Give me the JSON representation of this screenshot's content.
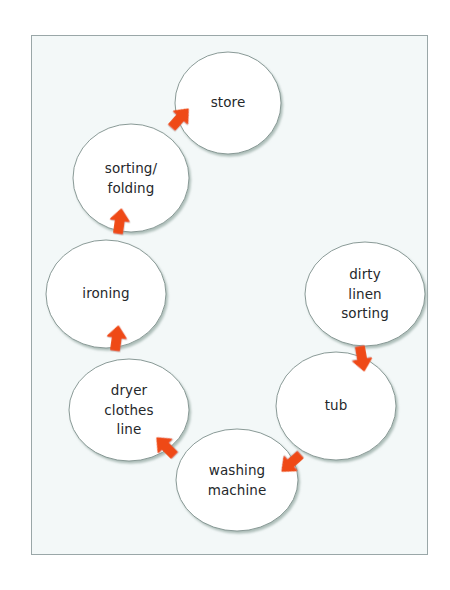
{
  "diagram": {
    "type": "cycle-flow",
    "frame": {
      "x": 31,
      "y": 35,
      "width": 397,
      "height": 520,
      "background_color": "#f3f8f8",
      "border_color": "#9aa7a8"
    },
    "style": {
      "node_fill": "#ffffff",
      "node_border_color": "#7d8f8b",
      "node_shadow_color": "#b9c6c2",
      "arrow_color": "#ef4a16",
      "label_color": "#25282b"
    },
    "nodes": [
      {
        "id": "store",
        "label": "store",
        "cx": 228,
        "cy": 103,
        "rx": 53,
        "ry": 51
      },
      {
        "id": "sorting-folding",
        "label": "sorting/\nfolding",
        "cx": 131,
        "cy": 178,
        "rx": 58,
        "ry": 54
      },
      {
        "id": "ironing",
        "label": "ironing",
        "cx": 106,
        "cy": 294,
        "rx": 60,
        "ry": 54
      },
      {
        "id": "dryer-clothes-line",
        "label": "dryer\nclothes\nline",
        "cx": 129,
        "cy": 410,
        "rx": 60,
        "ry": 51
      },
      {
        "id": "washing-machine",
        "label": "washing\nmachine",
        "cx": 237,
        "cy": 480,
        "rx": 61,
        "ry": 51
      },
      {
        "id": "tub",
        "label": "tub",
        "cx": 336,
        "cy": 406,
        "rx": 60,
        "ry": 54
      },
      {
        "id": "dirty-linen-sorting",
        "label": "dirty\nlinen\nsorting",
        "cx": 365,
        "cy": 294,
        "rx": 60,
        "ry": 52
      }
    ],
    "arrows": [
      {
        "id": "dirty-linen-sorting-to-tub",
        "from": "dirty-linen-sorting",
        "to": "tub",
        "x": 360,
        "y": 347,
        "rotation": 170
      },
      {
        "id": "tub-to-washing-machine",
        "from": "tub",
        "to": "washing-machine",
        "x": 300,
        "y": 455,
        "rotation": 228
      },
      {
        "id": "washing-machine-to-dryer",
        "from": "washing-machine",
        "to": "dryer-clothes-line",
        "x": 174,
        "y": 455,
        "rotation": 315
      },
      {
        "id": "dryer-to-ironing",
        "from": "dryer-clothes-line",
        "to": "ironing",
        "x": 115,
        "y": 350,
        "rotation": 8
      },
      {
        "id": "ironing-to-sorting-folding",
        "from": "ironing",
        "to": "sorting-folding",
        "x": 118,
        "y": 233,
        "rotation": 8
      },
      {
        "id": "sorting-folding-to-store",
        "from": "sorting-folding",
        "to": "store",
        "x": 172,
        "y": 127,
        "rotation": 42
      }
    ],
    "flow_order": [
      "dirty linen sorting",
      "tub",
      "washing machine",
      "dryer clothes line",
      "ironing",
      "sorting/folding",
      "store"
    ]
  }
}
